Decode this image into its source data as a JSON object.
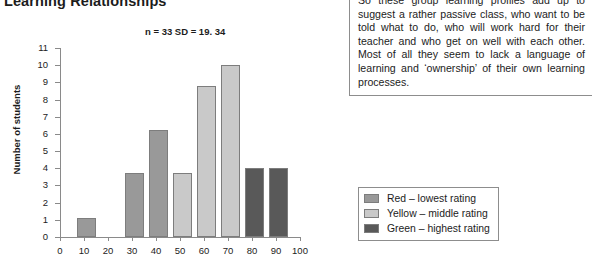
{
  "page_title": "Learning Relationships",
  "chart_data": {
    "type": "bar",
    "title": "Learning Relationships",
    "annotation": "n = 33 SD = 19. 34",
    "xlabel": "",
    "ylabel": "Number of students",
    "ylim": [
      0,
      11
    ],
    "ytick_step": 1,
    "yticks": [
      11,
      10,
      9,
      8,
      7,
      6,
      5,
      4,
      3,
      2,
      1,
      0
    ],
    "xticks": [
      0,
      10,
      20,
      30,
      40,
      50,
      60,
      70,
      80,
      90,
      100
    ],
    "xlim": [
      0,
      100
    ],
    "grid": false,
    "legend_position": "bottom-right-outside",
    "bar_align": "left-of-tick-interval",
    "categories": [
      10,
      30,
      40,
      50,
      60,
      70,
      80,
      90
    ],
    "values": [
      1.1,
      3.7,
      6.2,
      3.7,
      8.8,
      10.0,
      4.0,
      4.0
    ],
    "bar_colors": [
      "#999999",
      "#999999",
      "#999999",
      "#c9c9c9",
      "#c9c9c9",
      "#c9c9c9",
      "#595959",
      "#595959"
    ],
    "bars": [
      {
        "x": 10,
        "value": 1.1,
        "group": "red"
      },
      {
        "x": 30,
        "value": 3.7,
        "group": "red"
      },
      {
        "x": 40,
        "value": 6.2,
        "group": "red"
      },
      {
        "x": 50,
        "value": 3.7,
        "group": "yellow"
      },
      {
        "x": 60,
        "value": 8.8,
        "group": "yellow"
      },
      {
        "x": 70,
        "value": 10.0,
        "group": "yellow"
      },
      {
        "x": 80,
        "value": 4.0,
        "group": "green"
      },
      {
        "x": 90,
        "value": 4.0,
        "group": "green"
      }
    ],
    "legend": [
      {
        "label": "Red – lowest rating",
        "color": "#999999"
      },
      {
        "label": "Yellow – middle rating",
        "color": "#c9c9c9"
      },
      {
        "label": "Green – highest rating",
        "color": "#595959"
      }
    ]
  },
  "commentary": {
    "text": "So these group learning profiles add up to suggest a rather passive class, who want to be told what to do, who will work hard for their teacher and who get on well with each other. Most of all they seem to lack a language of learning and ‘ownership’ of their own learning processes."
  }
}
